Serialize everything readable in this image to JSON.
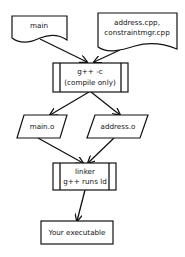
{
  "diagram": {
    "nodes": {
      "main_src": {
        "type": "document",
        "lines": [
          "main"
        ]
      },
      "cpp_src": {
        "type": "document",
        "lines": [
          "address.cpp,",
          "constraintmgr.cpp"
        ]
      },
      "compile": {
        "type": "process",
        "lines": [
          "g++ -c",
          "(compile only)"
        ]
      },
      "main_o": {
        "type": "data",
        "lines": [
          "main.o"
        ]
      },
      "address_o": {
        "type": "data",
        "lines": [
          "address.o"
        ]
      },
      "linker": {
        "type": "process",
        "lines": [
          "linker",
          "g++ runs ld"
        ]
      },
      "executable": {
        "type": "terminal",
        "lines": [
          "Your executable"
        ]
      }
    },
    "edges": [
      {
        "from": "main_src",
        "to": "compile"
      },
      {
        "from": "cpp_src",
        "to": "compile"
      },
      {
        "from": "compile",
        "to": "main_o"
      },
      {
        "from": "compile",
        "to": "address_o"
      },
      {
        "from": "main_o",
        "to": "linker"
      },
      {
        "from": "address_o",
        "to": "linker"
      },
      {
        "from": "linker",
        "to": "executable"
      }
    ],
    "colors": {
      "stroke": "#111111",
      "fill": "#ffffff"
    }
  }
}
